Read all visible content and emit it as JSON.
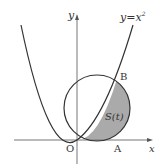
{
  "diagram": {
    "type": "math-figure",
    "curve_label": "y=x",
    "curve_label_exponent": "2",
    "axis_x_label": "x",
    "axis_y_label": "y",
    "origin_label": "O",
    "point_a_label": "A",
    "point_b_label": "B",
    "region_label": "S(t)",
    "colors": {
      "stroke": "#333333",
      "axis": "#777777",
      "shade": "#aaaaaa",
      "background": "#ffffff"
    }
  }
}
